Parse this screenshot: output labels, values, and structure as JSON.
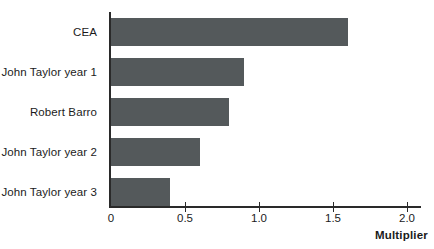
{
  "chart_data": {
    "type": "bar",
    "orientation": "horizontal",
    "title": "",
    "xlabel": "Multiplier",
    "ylabel": "",
    "categories": [
      "CEA",
      "John Taylor year 1",
      "Robert Barro",
      "John Taylor year 2",
      "John Taylor year 3"
    ],
    "values": [
      1.6,
      0.9,
      0.8,
      0.6,
      0.4
    ],
    "xlim": [
      0,
      2.15
    ],
    "xticks": [
      0,
      0.5,
      1.0,
      1.5,
      2.0
    ],
    "xtick_labels": [
      "0",
      "0.5",
      "1.0",
      "1.5",
      "2.0"
    ],
    "grid": false,
    "legend": null,
    "bar_color": "#54595b",
    "axis_color": "#2a2a2a",
    "background_color": "#ffffff"
  },
  "axis": {
    "x_title": "Multiplier"
  }
}
